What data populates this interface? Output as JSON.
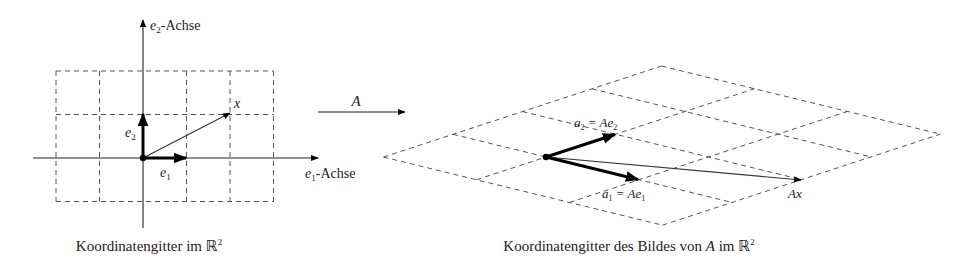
{
  "left_panel": {
    "axis_e1_label": "e",
    "axis_e1_sub": "1",
    "axis_e1_suffix": "-Achse",
    "axis_e2_label": "e",
    "axis_e2_sub": "2",
    "axis_e2_suffix": "-Achse",
    "vector_e1_label": "e",
    "vector_e1_sub": "1",
    "vector_e2_label": "e",
    "vector_e2_sub": "2",
    "vector_x_label": "x",
    "caption": "Koordinatengitter im ",
    "caption_space": "ℝ",
    "caption_exp": "2"
  },
  "mapping": {
    "label": "A"
  },
  "right_panel": {
    "a2_label": "a",
    "a2_sub": "2",
    "a2_eq": " = Ae",
    "a2_eq_sub": "2",
    "a1_label": "a",
    "a1_sub": "1",
    "a1_eq": " = Ae",
    "a1_eq_sub": "1",
    "ax_label": "Ax",
    "caption_pre": "Koordinatengitter des Bildes von ",
    "caption_A": "A",
    "caption_post": " im ",
    "caption_space": "ℝ",
    "caption_exp": "2"
  },
  "geometry": {
    "left_origin": [
      143,
      158
    ],
    "left_unit": 43.5,
    "left_grid_x_range": [
      -2,
      3
    ],
    "left_grid_y_range": [
      -1,
      2
    ],
    "right_origin": [
      546,
      157
    ],
    "a1": [
      93,
      22.7
    ],
    "a2": [
      69.5,
      -22.75
    ],
    "right_grid_a1_range": [
      -1,
      2
    ],
    "right_grid_a2_range": [
      -1,
      3
    ],
    "x_coords": [
      2,
      1
    ]
  },
  "colors": {
    "ink": "#000000",
    "grid": "#555555",
    "background": "#ffffff"
  }
}
